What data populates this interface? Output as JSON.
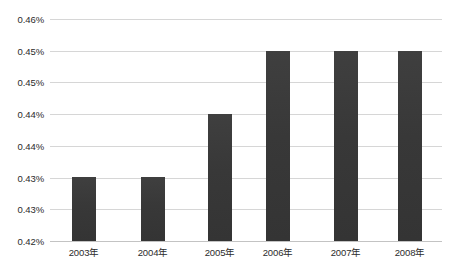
{
  "chart_data": {
    "type": "bar",
    "title": "",
    "subtitle": "",
    "xlabel": "",
    "ylabel": "",
    "categories": [
      "2003年",
      "2004年",
      "2005年",
      "2006年",
      "2007年",
      "2008年"
    ],
    "values": [
      0.0043,
      0.0043,
      0.0044,
      0.00449,
      0.00449,
      0.00449
    ],
    "value_labels": [
      "0.43%",
      "0.43%",
      "0.44%",
      "0.45%",
      "0.45%",
      "0.45%"
    ],
    "series": [
      {
        "name": "",
        "values": [
          0.0043,
          0.0043,
          0.0044,
          0.00449,
          0.00449,
          0.00449
        ]
      }
    ],
    "ylim": [
      0.0042,
      0.0046
    ],
    "ytick_values": [
      0.0042,
      0.00425,
      0.0043,
      0.00435,
      0.0044,
      0.00445,
      0.0045,
      0.00455
    ],
    "ytick_labels_bottom_to_top": [
      "0.42%",
      "0.43%",
      "0.43%",
      "0.44%",
      "0.44%",
      "0.45%",
      "0.45%",
      "0.46%"
    ],
    "ytick_labels_top_to_bottom": [
      "0.46%",
      "0.45%",
      "0.45%",
      "0.44%",
      "0.44%",
      "0.43%",
      "0.43%",
      "0.42%"
    ],
    "grid": true,
    "grid_axis": "y",
    "legend": false,
    "legend_position": "none",
    "bar_color": "#3a3a3a",
    "gridline_color": "#d6d6d6",
    "background_color": "#ffffff",
    "axis_color": "#c3c3c3",
    "text_color": "#2b2b2b"
  },
  "yaxis": {
    "ticks": [
      {
        "label": "0.46%",
        "top_px": 19
      },
      {
        "label": "0.45%",
        "top_px": 50.7
      },
      {
        "label": "0.45%",
        "top_px": 82.4
      },
      {
        "label": "0.44%",
        "top_px": 114.1
      },
      {
        "label": "0.44%",
        "top_px": 145.9
      },
      {
        "label": "0.43%",
        "top_px": 177.6
      },
      {
        "label": "0.43%",
        "top_px": 209.3
      },
      {
        "label": "0.42%",
        "top_px": 241
      }
    ]
  },
  "xaxis": {
    "ticks": [
      {
        "label": "2003年",
        "center_px": 34
      },
      {
        "label": "2004年",
        "center_px": 103
      },
      {
        "label": "2005年",
        "center_px": 170
      },
      {
        "label": "2006年",
        "center_px": 228
      },
      {
        "label": "2007年",
        "center_px": 296
      },
      {
        "label": "2008年",
        "center_px": 360
      }
    ]
  },
  "bars": [
    {
      "name": "bar-2003",
      "left_px": 22,
      "width_px": 24,
      "height_px": 64
    },
    {
      "name": "bar-2004",
      "left_px": 91,
      "width_px": 24,
      "height_px": 64
    },
    {
      "name": "bar-2005",
      "left_px": 158,
      "width_px": 24,
      "height_px": 127
    },
    {
      "name": "bar-2006",
      "left_px": 216,
      "width_px": 24,
      "height_px": 190
    },
    {
      "name": "bar-2007",
      "left_px": 284,
      "width_px": 24,
      "height_px": 190
    },
    {
      "name": "bar-2008",
      "left_px": 348,
      "width_px": 24,
      "height_px": 190
    }
  ]
}
